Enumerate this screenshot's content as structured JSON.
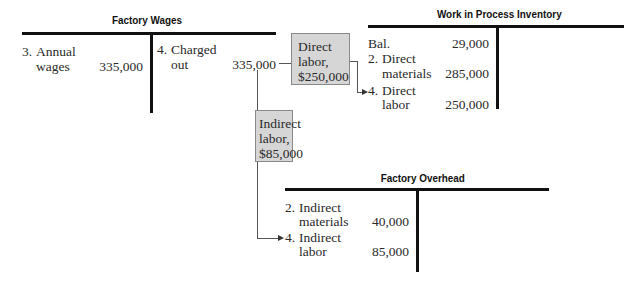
{
  "accounts": {
    "factory_wages": {
      "title": "Factory Wages",
      "debit": [
        {
          "num": "3.",
          "label1": "Annual",
          "label2": "wages",
          "amount": "335,000"
        }
      ],
      "credit": [
        {
          "num": "4.",
          "label1": "Charged",
          "label2": "out",
          "amount": "335,000"
        }
      ]
    },
    "wip_inventory": {
      "title": "Work in Process Inventory",
      "debit": [
        {
          "label": "Bal.",
          "amount": "29,000"
        },
        {
          "num": "2.",
          "label1": "Direct",
          "label2": "materials",
          "amount": "285,000"
        },
        {
          "num": "4.",
          "label1": "Direct",
          "label2": "labor",
          "amount": "250,000"
        }
      ]
    },
    "factory_overhead": {
      "title": "Factory Overhead",
      "debit": [
        {
          "num": "2.",
          "label1": "Indirect",
          "label2": "materials",
          "amount": "40,000"
        },
        {
          "num": "4.",
          "label1": "Indirect",
          "label2": "labor",
          "amount": "85,000"
        }
      ]
    }
  },
  "boxes": {
    "direct_labor": {
      "line1": "Direct",
      "line2": "labor,",
      "line3": "$250,000"
    },
    "indirect_labor": {
      "line1": "Indirect",
      "line2": "labor,",
      "line3": "$85,000"
    }
  },
  "colors": {
    "box_fill": "#d6d6d6",
    "line": "#111111"
  }
}
